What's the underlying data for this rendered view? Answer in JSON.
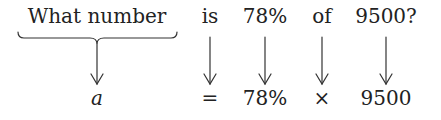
{
  "question": {
    "words": [
      {
        "text": "What number",
        "x": 97
      },
      {
        "text": "is",
        "x": 210
      },
      {
        "text": "78%",
        "x": 265
      },
      {
        "text": "of",
        "x": 322
      },
      {
        "text": "9500?",
        "x": 386
      }
    ]
  },
  "equation": {
    "terms": [
      {
        "text": "a",
        "x": 97,
        "italic": true
      },
      {
        "text": "=",
        "x": 210
      },
      {
        "text": "78%",
        "x": 265
      },
      {
        "text": "×",
        "x": 322
      },
      {
        "text": "9500",
        "x": 386
      }
    ]
  },
  "connectors": {
    "brace": {
      "x1": 18,
      "x2": 177,
      "center": 97,
      "top": 32,
      "bottom": 44
    },
    "arrows": [
      {
        "x": 97,
        "y1": 44,
        "y2": 84,
        "icon": "down-arrow-icon"
      },
      {
        "x": 210,
        "y1": 37,
        "y2": 84,
        "icon": "down-arrow-icon"
      },
      {
        "x": 265,
        "y1": 37,
        "y2": 84,
        "icon": "down-arrow-icon"
      },
      {
        "x": 322,
        "y1": 37,
        "y2": 84,
        "icon": "down-arrow-icon"
      },
      {
        "x": 386,
        "y1": 37,
        "y2": 84,
        "icon": "down-arrow-icon"
      }
    ],
    "stroke_color": "#333333"
  }
}
